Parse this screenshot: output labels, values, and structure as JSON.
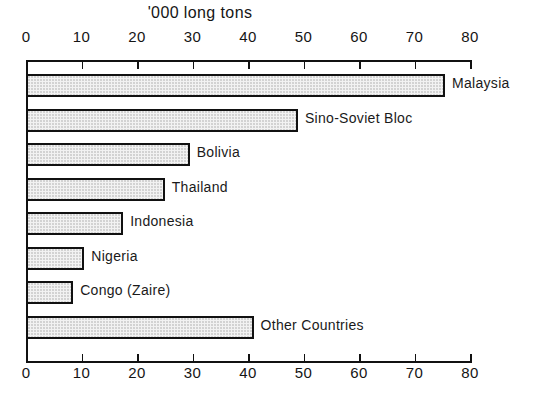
{
  "chart_data": {
    "type": "bar",
    "orientation": "horizontal",
    "title": "'000 long tons",
    "xlabel": "",
    "ylabel": "",
    "xlim": [
      0,
      80
    ],
    "xticks": [
      0,
      10,
      20,
      30,
      40,
      50,
      60,
      70,
      80
    ],
    "xtick_labels": [
      "0",
      "10",
      "20",
      "30",
      "40",
      "50",
      "60",
      "70",
      "80"
    ],
    "grid": false,
    "legend": "none",
    "axis_ticks_position": "top and bottom",
    "categories": [
      "Malaysia",
      "Sino-Soviet Bloc",
      "Bolivia",
      "Thailand",
      "Indonesia",
      "Nigeria",
      "Congo (Zaire)",
      "Other Countries"
    ],
    "values": [
      75.5,
      49,
      29.5,
      25,
      17.5,
      10.5,
      8.5,
      41
    ],
    "bar_fill_color": "#f2f2f2",
    "bar_stipple_color": "#c2c2c2",
    "bar_edge_color": "#111111",
    "background_color": "#ffffff"
  }
}
